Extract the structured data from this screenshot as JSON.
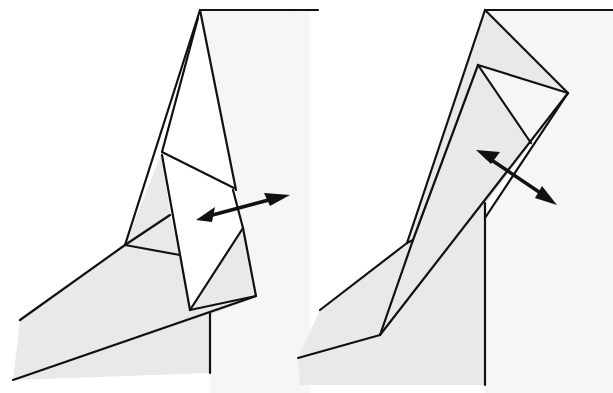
{
  "diagram": {
    "type": "origami-folding-steps",
    "steps": [
      {
        "id": "step-left",
        "action": "swing flap (double arrow, horizontal)"
      },
      {
        "id": "step-right",
        "action": "swing flap (double arrow, diagonal)"
      }
    ],
    "colors": {
      "line": "#111111",
      "shade": "#e9e9e9",
      "paper": "#f6f6f6",
      "background": "#ffffff"
    }
  }
}
